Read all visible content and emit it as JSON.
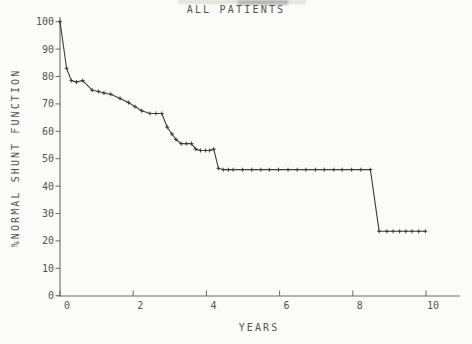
{
  "colors": {
    "paper": "#fbfbf8",
    "ink": "#54544e",
    "axis": "#6b6b65",
    "curve": "#3c3c38"
  },
  "chart_data": {
    "type": "line",
    "title": "ALL PATIENTS",
    "xlabel": "YEARS",
    "ylabel": "%NORMAL SHUNT FUNCTION",
    "xlim": [
      0,
      11
    ],
    "ylim": [
      0,
      100
    ],
    "x_ticks": [
      0,
      2,
      4,
      6,
      8,
      10
    ],
    "y_ticks": [
      0,
      10,
      20,
      30,
      40,
      50,
      60,
      70,
      80,
      90,
      100
    ],
    "grid": false,
    "legend": false,
    "marker": "plus",
    "series": [
      {
        "name": "ALL PATIENTS",
        "points": [
          [
            0,
            100
          ],
          [
            0.18,
            83
          ],
          [
            0.31,
            78.5
          ],
          [
            0.45,
            78
          ],
          [
            0.62,
            78.5
          ],
          [
            0.88,
            75
          ],
          [
            1.05,
            74.5
          ],
          [
            1.2,
            74
          ],
          [
            1.39,
            73.5
          ],
          [
            1.64,
            72
          ],
          [
            1.87,
            70.5
          ],
          [
            2.05,
            69
          ],
          [
            2.23,
            67.5
          ],
          [
            2.46,
            66.5
          ],
          [
            2.62,
            66.5
          ],
          [
            2.78,
            66.5
          ],
          [
            2.93,
            61.5
          ],
          [
            3.06,
            59
          ],
          [
            3.17,
            57
          ],
          [
            3.31,
            55.5
          ],
          [
            3.45,
            55.5
          ],
          [
            3.59,
            55.5
          ],
          [
            3.71,
            53.5
          ],
          [
            3.84,
            53
          ],
          [
            3.98,
            53
          ],
          [
            4.09,
            53
          ],
          [
            4.2,
            53.5
          ],
          [
            4.33,
            46.5
          ],
          [
            4.46,
            46
          ],
          [
            4.6,
            46
          ],
          [
            4.73,
            46
          ],
          [
            4.99,
            46
          ],
          [
            5.24,
            46
          ],
          [
            5.49,
            46
          ],
          [
            5.72,
            46
          ],
          [
            5.97,
            46
          ],
          [
            6.23,
            46
          ],
          [
            6.48,
            46
          ],
          [
            6.72,
            46
          ],
          [
            6.98,
            46
          ],
          [
            7.22,
            46
          ],
          [
            7.48,
            46
          ],
          [
            7.71,
            46
          ],
          [
            7.97,
            46
          ],
          [
            8.22,
            46
          ],
          [
            8.48,
            46
          ],
          [
            8.72,
            23.5
          ],
          [
            8.93,
            23.5
          ],
          [
            9.1,
            23.5
          ],
          [
            9.28,
            23.5
          ],
          [
            9.45,
            23.5
          ],
          [
            9.62,
            23.5
          ],
          [
            9.8,
            23.5
          ],
          [
            9.98,
            23.5
          ]
        ]
      }
    ]
  }
}
